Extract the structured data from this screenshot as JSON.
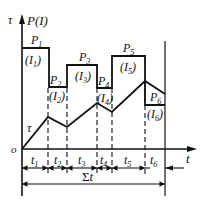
{
  "diagram": {
    "type": "load-temperature timing diagram",
    "axes": {
      "y_label_tau": "τ",
      "y_label_power": "P(I)",
      "x_label": "t",
      "origin": "o"
    },
    "power_steps": [
      {
        "power": "P",
        "power_sub": "1",
        "current": "(I",
        "current_sub": "1",
        "current_close": ")"
      },
      {
        "power": "P",
        "power_sub": "2",
        "current": "(I",
        "current_sub": "2",
        "current_close": ")"
      },
      {
        "power": "P",
        "power_sub": "3",
        "current": "(I",
        "current_sub": "3",
        "current_close": ")"
      },
      {
        "power": "P",
        "power_sub": "4",
        "current": "(I",
        "current_sub": "4",
        "current_close": ")"
      },
      {
        "power": "P",
        "power_sub": "5",
        "current": "(I",
        "current_sub": "5",
        "current_close": ")"
      },
      {
        "power": "P",
        "power_sub": "6",
        "current": "(I",
        "current_sub": "6",
        "current_close": ")"
      }
    ],
    "curve_label": "τ",
    "intervals": [
      {
        "label": "t",
        "sub": "1"
      },
      {
        "label": "t",
        "sub": "2"
      },
      {
        "label": "t",
        "sub": "3"
      },
      {
        "label": "t",
        "sub": "4"
      },
      {
        "label": "t",
        "sub": "5"
      },
      {
        "label": "t",
        "sub": "6"
      }
    ],
    "total": {
      "sigma": "Σ",
      "label": "t"
    },
    "colors": {
      "line": "#111111",
      "background": "#ffffff"
    }
  }
}
